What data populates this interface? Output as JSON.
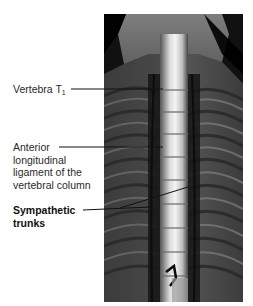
{
  "figure": {
    "type": "anatomical photograph",
    "colors": {
      "background": "#ffffff",
      "photo_dark": "#1a1a1a",
      "leader_line": "#111111",
      "label_text": "#2a2a2a"
    }
  },
  "labels": [
    {
      "id": "vertebra_t1",
      "text": "Vertebra T",
      "subscript": "1",
      "bold": false
    },
    {
      "id": "anterior_ligament",
      "lines": [
        "Anterior",
        "longitudinal",
        "ligament of the",
        "vertebral column"
      ],
      "bold": false
    },
    {
      "id": "sympathetic_trunks",
      "lines": [
        "Sympathetic",
        "trunks"
      ],
      "bold": true
    }
  ]
}
